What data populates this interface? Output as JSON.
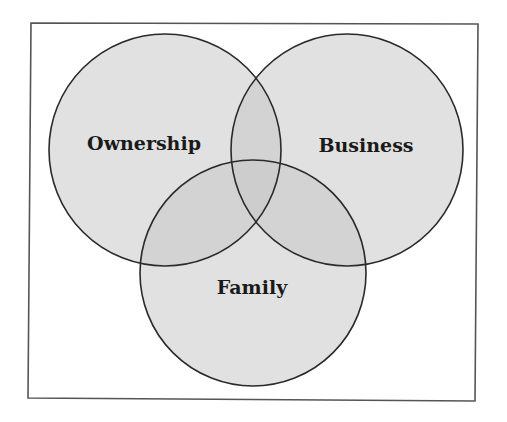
{
  "diagram": {
    "type": "venn",
    "title": "",
    "frame": {
      "stroke": "#555555",
      "points": [
        [
          31,
          23
        ],
        [
          478,
          24
        ],
        [
          475,
          401
        ],
        [
          28,
          398
        ]
      ]
    },
    "style": {
      "circle_fill": "#c8c8c8",
      "circle_fill_opacity": 0.55,
      "circle_stroke": "#2a2a2a",
      "circle_stroke_width": 1.6,
      "label_color": "#1a1a1a",
      "label_font_size": 19
    },
    "sets": [
      {
        "id": "ownership",
        "label": "Ownership",
        "cx": 165,
        "cy": 150,
        "r": 116,
        "label_x": 144,
        "label_y": 150
      },
      {
        "id": "business",
        "label": "Business",
        "cx": 347,
        "cy": 150,
        "r": 116,
        "label_x": 366,
        "label_y": 152
      },
      {
        "id": "family",
        "label": "Family",
        "cx": 253,
        "cy": 273,
        "r": 113,
        "label_x": 252,
        "label_y": 294
      }
    ],
    "intersections": [
      {
        "sets": [
          "ownership",
          "business"
        ],
        "label": ""
      },
      {
        "sets": [
          "ownership",
          "family"
        ],
        "label": ""
      },
      {
        "sets": [
          "business",
          "family"
        ],
        "label": ""
      },
      {
        "sets": [
          "ownership",
          "business",
          "family"
        ],
        "label": ""
      }
    ]
  }
}
